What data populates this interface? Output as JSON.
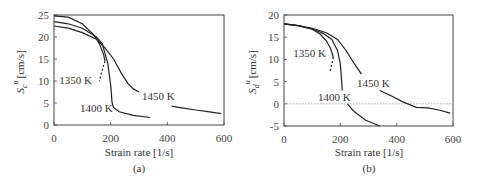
{
  "chart_data": [
    {
      "id": "a",
      "type": "line",
      "caption": "(a)",
      "xlabel": "Strain rate [1/s]",
      "ylabel": "S_c^u [cm/s]",
      "ylabel_main": "S",
      "ylabel_sub": "c",
      "ylabel_sup": "u",
      "ylabel_unit": "[cm/s]",
      "xlim": [
        0,
        600
      ],
      "ylim": [
        0,
        25
      ],
      "xticks": [
        "0",
        "200",
        "400",
        "600"
      ],
      "yticks": [
        "0",
        "5",
        "10",
        "15",
        "20",
        "25"
      ],
      "grid": false,
      "series": [
        {
          "name": "1350 K",
          "label": "1350 K",
          "x": [
            0,
            50,
            100,
            140,
            160,
            175,
            180
          ],
          "y": [
            24.8,
            24.5,
            23.0,
            20.5,
            18.5,
            16.0,
            14.5
          ],
          "dashed_x": [
            180,
            170,
            160
          ],
          "dashed_y": [
            14.5,
            12.5,
            10.0
          ]
        },
        {
          "name": "1400 K",
          "label": "1400 K",
          "x": [
            0,
            50,
            100,
            150,
            170,
            190,
            200,
            205,
            210,
            230,
            280,
            340
          ],
          "y": [
            23.5,
            23.0,
            22.0,
            20.0,
            18.5,
            14.0,
            9.0,
            5.0,
            4.0,
            3.0,
            2.2,
            1.7
          ]
        },
        {
          "name": "1450 K",
          "label": "1450 K",
          "x": [
            0,
            50,
            100,
            150,
            180,
            210,
            240,
            260,
            280,
            300
          ],
          "y": [
            22.5,
            22.0,
            21.0,
            19.5,
            17.5,
            15.0,
            11.5,
            9.5,
            8.2,
            7.5
          ],
          "x2": [
            415,
            450,
            500,
            550,
            590
          ],
          "y2": [
            4.3,
            3.9,
            3.4,
            3.0,
            2.6
          ]
        }
      ]
    },
    {
      "id": "b",
      "type": "line",
      "caption": "(b)",
      "xlabel": "Strain rate [1/s]",
      "ylabel": "S_d^u [cm/s]",
      "ylabel_main": "S",
      "ylabel_sub": "d",
      "ylabel_sup": "u",
      "ylabel_unit": "[cm/s]",
      "xlim": [
        0,
        600
      ],
      "ylim": [
        -5,
        20
      ],
      "xticks": [
        "0",
        "200",
        "400",
        "600"
      ],
      "yticks": [
        "-5",
        "0",
        "5",
        "10",
        "15",
        "20"
      ],
      "grid": false,
      "reference_line_y": 0,
      "series": [
        {
          "name": "1350 K",
          "label": "1350 K",
          "x": [
            0,
            50,
            100,
            130,
            150,
            165,
            175
          ],
          "y": [
            18.0,
            17.6,
            16.8,
            15.6,
            14.2,
            12.5,
            10.5
          ],
          "dashed_x": [
            175,
            170,
            162
          ],
          "dashed_y": [
            10.5,
            9.0,
            7.0
          ]
        },
        {
          "name": "1400 K",
          "label": "1400 K",
          "x": [
            0,
            50,
            100,
            140,
            170,
            190,
            200,
            205,
            207
          ],
          "y": [
            18.0,
            17.6,
            16.9,
            15.8,
            14.5,
            12.0,
            9.0,
            5.0,
            3.0
          ],
          "x2": [
            225,
            250,
            290,
            340
          ],
          "y2": [
            0.0,
            -1.8,
            -3.7,
            -5.0
          ]
        },
        {
          "name": "1450 K",
          "label": "1450 K",
          "x": [
            0,
            50,
            100,
            150,
            190,
            220,
            250,
            275
          ],
          "y": [
            18.0,
            17.6,
            17.0,
            16.0,
            14.5,
            12.0,
            9.0,
            6.7
          ],
          "x2": [
            340,
            380,
            420,
            470,
            510,
            550,
            590
          ],
          "y2": [
            3.0,
            1.8,
            0.5,
            -0.8,
            -0.9,
            -1.4,
            -2.1
          ]
        }
      ]
    }
  ]
}
